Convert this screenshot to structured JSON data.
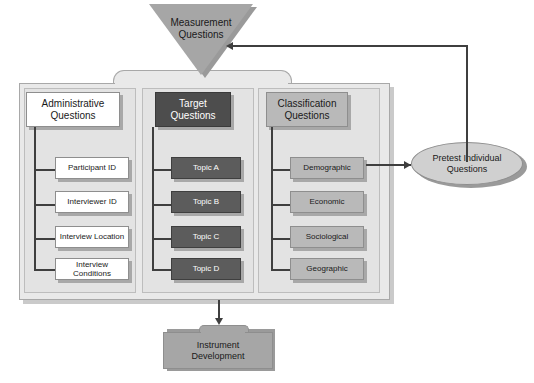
{
  "diagram": {
    "colors": {
      "page_background": "#ffffff",
      "container_fill": "#e9e9e9",
      "column_panel_fill": "#e3e3e3",
      "administrative_fill": "#ffffff",
      "target_fill": "#4d4d4d",
      "target_leaf_fill": "#5c5c5c",
      "classification_fill": "#b9b9b9",
      "triangle_fill": "#a6a6a6",
      "ellipse_fill": "#d0d0d0",
      "instrument_fill": "#a6a6a6",
      "connector": "#3f3f3f",
      "shadow": "#9a9a9a"
    }
  },
  "measurement": {
    "label_line1": "Measurement",
    "label_line2": "Questions",
    "shape": "inverted-triangle"
  },
  "columns": [
    {
      "key": "administrative",
      "header_line1": "Administrative",
      "header_line2": "Questions",
      "items": [
        {
          "label": "Participant ID"
        },
        {
          "label": "Interviewer ID"
        },
        {
          "label": "Interview Location"
        },
        {
          "label": "Interview Conditions"
        }
      ]
    },
    {
      "key": "target",
      "header_line1": "Target",
      "header_line2": "Questions",
      "items": [
        {
          "label": "Topic A"
        },
        {
          "label": "Topic B"
        },
        {
          "label": "Topic C"
        },
        {
          "label": "Topic D"
        }
      ]
    },
    {
      "key": "classification",
      "header_line1": "Classification",
      "header_line2": "Questions",
      "items": [
        {
          "label": "Demographic"
        },
        {
          "label": "Economic"
        },
        {
          "label": "Sociological"
        },
        {
          "label": "Geographic"
        }
      ]
    }
  ],
  "pretest": {
    "label_line1": "Pretest Individual",
    "label_line2": "Questions",
    "shape": "ellipse"
  },
  "instrument": {
    "label_line1": "Instrument",
    "label_line2": "Development",
    "shape": "folder"
  }
}
